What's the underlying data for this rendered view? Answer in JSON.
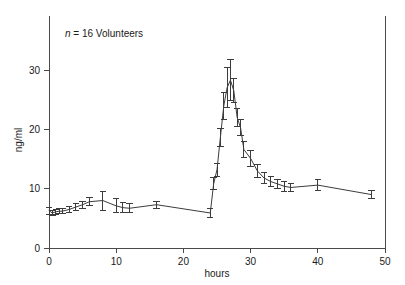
{
  "chart_data": {
    "type": "line",
    "title": "",
    "subtitle": "",
    "xlabel": "hours",
    "ylabel": "ng/ml",
    "xlim": [
      0,
      50
    ],
    "ylim": [
      0,
      35
    ],
    "xticks": [
      0,
      10,
      20,
      30,
      40,
      50
    ],
    "yticks": [
      0,
      10,
      20,
      30
    ],
    "xticklabels": [
      "0",
      "10",
      "20",
      "30",
      "40",
      "50"
    ],
    "yticklabels": [
      "0",
      "10",
      "20",
      "30"
    ],
    "grid": false,
    "legend": null,
    "error_bars": "vertical, symmetric (SEM)",
    "annotations": [
      {
        "text_italic": "n",
        "text": " = 16 Volunteers",
        "x": 2.0,
        "y": 33.0
      }
    ],
    "series": [
      {
        "name": "Plasma concentration",
        "marker": "none",
        "color": "#3c3c3c",
        "x": [
          0.0,
          0.5,
          1.0,
          1.5,
          2.0,
          3.0,
          4.0,
          5.0,
          6.0,
          8.0,
          10.0,
          11.0,
          12.0,
          16.0,
          24.0,
          24.5,
          25.0,
          25.5,
          26.0,
          26.5,
          27.0,
          27.5,
          28.0,
          28.5,
          29.0,
          30.0,
          31.0,
          32.0,
          33.0,
          34.0,
          35.0,
          36.0,
          40.0,
          48.0
        ],
        "y": [
          6.3,
          5.9,
          6.1,
          6.2,
          6.2,
          6.5,
          6.9,
          7.3,
          7.8,
          8.0,
          7.1,
          6.8,
          6.7,
          7.3,
          5.9,
          10.8,
          13.2,
          18.6,
          23.9,
          27.0,
          28.3,
          26.5,
          22.0,
          20.3,
          16.6,
          15.1,
          13.0,
          11.8,
          11.2,
          10.8,
          10.4,
          10.2,
          10.6,
          9.0
        ],
        "yerr": [
          0.6,
          0.45,
          0.4,
          0.4,
          0.4,
          0.5,
          0.6,
          0.6,
          0.7,
          1.6,
          1.2,
          0.9,
          0.8,
          0.6,
          0.7,
          1.0,
          1.1,
          1.5,
          2.3,
          3.4,
          3.5,
          2.0,
          1.5,
          1.4,
          1.3,
          1.4,
          1.1,
          1.0,
          0.9,
          0.8,
          0.8,
          0.7,
          0.9,
          0.7
        ]
      }
    ]
  },
  "figure": {
    "background_color": "#ffffff",
    "line_color": "#3c3c3c",
    "axis_color": "#4a4a4a",
    "text_color": "#1a1a1a"
  }
}
